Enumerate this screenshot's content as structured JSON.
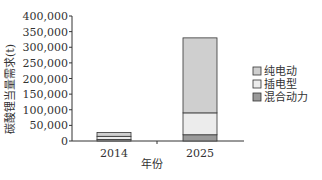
{
  "chart_data": {
    "type": "bar",
    "stacked": true,
    "title": "",
    "xlabel": "年份",
    "ylabel": "碳酸锂当量需求(t)",
    "categories": [
      "2014",
      "2025"
    ],
    "series": [
      {
        "name": "混合动力",
        "values": [
          5000,
          20000
        ],
        "color": "#9a9a9a"
      },
      {
        "name": "插电型",
        "values": [
          10000,
          70000
        ],
        "color": "#ececec"
      },
      {
        "name": "纯电动",
        "values": [
          12000,
          240000
        ],
        "color": "#cfcfcf"
      }
    ],
    "ylim": [
      0,
      400000
    ],
    "yticks": [
      0,
      50000,
      100000,
      150000,
      200000,
      250000,
      300000,
      350000,
      400000
    ],
    "ytick_labels": [
      "0",
      "50,000",
      "100,000",
      "150,000",
      "200,000",
      "250,000",
      "300,000",
      "350,000",
      "400,000"
    ],
    "grid": false,
    "legend_position": "right",
    "legend": [
      "纯电动",
      "插电型",
      "混合动力"
    ]
  }
}
